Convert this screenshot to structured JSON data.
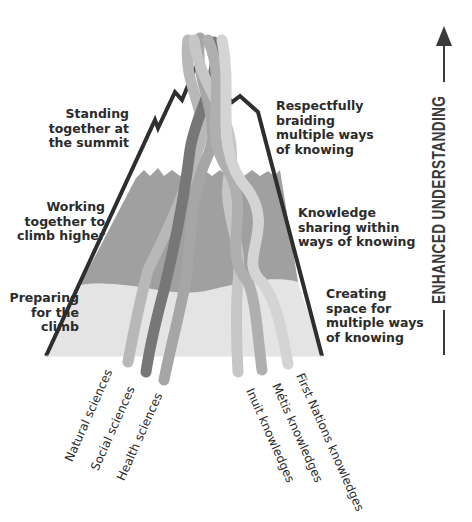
{
  "diagram": {
    "title_axis": "ENHANCED UNDERSTANDING",
    "stages_left": [
      {
        "id": "summit",
        "text": "Standing\ntogether at\nthe summit"
      },
      {
        "id": "climb-higher",
        "text": "Working\ntogether to\nclimb higher"
      },
      {
        "id": "preparing",
        "text": "Preparing\nfor the\nclimb"
      }
    ],
    "stages_right": [
      {
        "id": "braiding",
        "text": "Respectfully\nbraiding\nmultiple ways\nof knowing"
      },
      {
        "id": "sharing",
        "text": "Knowledge\nsharing within\nways of knowing"
      },
      {
        "id": "creating-space",
        "text": "Creating\nspace for\nmultiple ways\nof knowing"
      }
    ],
    "strands": [
      {
        "label": "Natural sciences",
        "color": "#b5b5b5"
      },
      {
        "label": "Social sciences",
        "color": "#7a7a7a"
      },
      {
        "label": "Health sciences",
        "color": "#a8a8a8"
      },
      {
        "label": "Inuit knowledges",
        "color": "#c4c4c4"
      },
      {
        "label": "Métis knowledges",
        "color": "#b0b0b0"
      },
      {
        "label": "First Nations knowledges",
        "color": "#d2d2d2"
      }
    ],
    "colors": {
      "outline": "#2e2e2e",
      "upper_band": "#9e9e9e",
      "lower_band": "#e3e3e3",
      "text": "#2b2b2b"
    }
  }
}
